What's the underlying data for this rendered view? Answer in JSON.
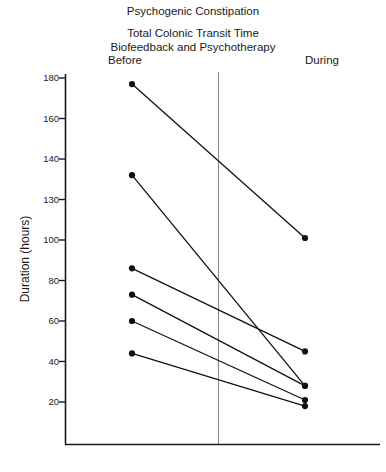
{
  "figure": {
    "title": "Psychogenic Constipation",
    "subtitle_line1": "Total Colonic Transit Time",
    "subtitle_line2": "Biofeedback and Psychotherapy",
    "y_axis_label": "Duration (hours)",
    "group_before": "Before",
    "group_during": "During"
  },
  "chart_data": {
    "type": "line",
    "title": "Psychogenic Constipation",
    "subtitle": "Total Colonic Transit Time / Biofeedback and Psychotherapy",
    "xlabel": "",
    "ylabel": "Duration (hours)",
    "categories": [
      "Before",
      "During"
    ],
    "tick_labels": [
      "180",
      "160",
      "140",
      "130",
      "100",
      "80",
      "60",
      "40",
      "20"
    ],
    "tick_values": [
      180,
      160,
      140,
      120,
      100,
      80,
      60,
      40,
      20
    ],
    "ylim": [
      0,
      180
    ],
    "grid": false,
    "legend": "none",
    "annotations": [
      "Vertical reference line drawn between the Before and During columns"
    ],
    "series": [
      {
        "name": "Subject 1",
        "values": [
          177,
          101
        ]
      },
      {
        "name": "Subject 2",
        "values": [
          132,
          28
        ]
      },
      {
        "name": "Subject 3",
        "values": [
          86,
          45
        ]
      },
      {
        "name": "Subject 4",
        "values": [
          73,
          28
        ]
      },
      {
        "name": "Subject 5",
        "values": [
          60,
          21
        ]
      },
      {
        "name": "Subject 6",
        "values": [
          44,
          18
        ]
      }
    ]
  }
}
